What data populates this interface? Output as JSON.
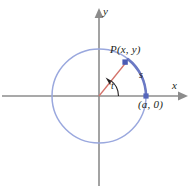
{
  "figure": {
    "axes": {
      "x_label": "x",
      "y_label": "y",
      "color": "#8c8c8c"
    },
    "labels": {
      "point_P": "P(x, y)",
      "point_a": "(a, 0)",
      "arc_s": "s",
      "angle_t": "t"
    },
    "colors": {
      "circle": "#9aa8de",
      "arc": "#6b79c4",
      "radius": "#d4736b",
      "point": "#5566bb",
      "axis": "#8c8c8c",
      "text": "#231f20",
      "background": "#ffffff"
    },
    "geometry": {
      "center_x": 99,
      "center_y": 96,
      "radius": 47,
      "point_P_x": 125,
      "point_P_y": 63,
      "point_a_x": 146,
      "point_a_y": 96,
      "angle_t_degrees": 52,
      "angle_arc_radius": 19
    }
  }
}
